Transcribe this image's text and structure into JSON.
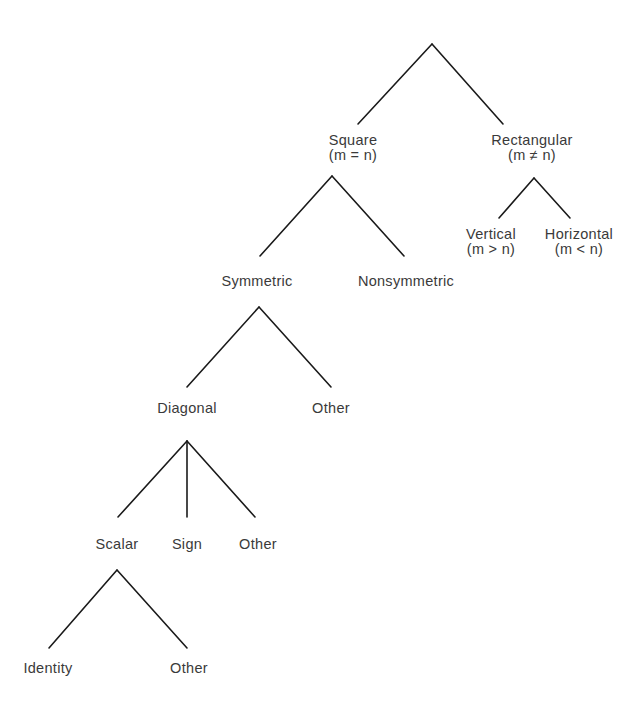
{
  "diagram": {
    "type": "tree",
    "title": "",
    "root": {
      "label": "",
      "children": [
        "square",
        "rectangular"
      ]
    },
    "nodes": {
      "square": {
        "label": "Square",
        "condition": "(m = n)",
        "x": 353,
        "y": 133
      },
      "rectangular": {
        "label": "Rectangular",
        "condition": "(m ≠ n)",
        "x": 532,
        "y": 133
      },
      "vertical": {
        "label": "Vertical",
        "condition": "(m > n)",
        "x": 491,
        "y": 227
      },
      "horizontal": {
        "label": "Horizontal",
        "condition": "(m < n)",
        "x": 579,
        "y": 227
      },
      "symmetric": {
        "label": "Symmetric",
        "x": 257,
        "y": 274
      },
      "nonsymmetric": {
        "label": "Nonsymmetric",
        "x": 406,
        "y": 274
      },
      "diagonal": {
        "label": "Diagonal",
        "x": 187,
        "y": 401
      },
      "other_symmetric": {
        "label": "Other",
        "x": 331,
        "y": 401
      },
      "scalar": {
        "label": "Scalar",
        "x": 117,
        "y": 537
      },
      "sign": {
        "label": "Sign",
        "x": 187,
        "y": 537
      },
      "other_diagonal": {
        "label": "Other",
        "x": 258,
        "y": 537
      },
      "identity": {
        "label": "Identity",
        "x": 48,
        "y": 661
      },
      "other_scalar": {
        "label": "Other",
        "x": 189,
        "y": 661
      }
    },
    "edges": [
      {
        "from": "root",
        "to": "square",
        "x1": 432,
        "y1": 44,
        "x2": 358,
        "y2": 124
      },
      {
        "from": "root",
        "to": "rectangular",
        "x1": 432,
        "y1": 44,
        "x2": 503,
        "y2": 124
      },
      {
        "from": "rectangular",
        "to": "vertical",
        "x1": 534,
        "y1": 178,
        "x2": 499,
        "y2": 218
      },
      {
        "from": "rectangular",
        "to": "horizontal",
        "x1": 534,
        "y1": 178,
        "x2": 570,
        "y2": 218
      },
      {
        "from": "square",
        "to": "symmetric",
        "x1": 332,
        "y1": 176,
        "x2": 260,
        "y2": 256
      },
      {
        "from": "square",
        "to": "nonsymmetric",
        "x1": 332,
        "y1": 176,
        "x2": 404,
        "y2": 256
      },
      {
        "from": "symmetric",
        "to": "diagonal",
        "x1": 259,
        "y1": 307,
        "x2": 187,
        "y2": 387
      },
      {
        "from": "symmetric",
        "to": "other_symmetric",
        "x1": 259,
        "y1": 307,
        "x2": 331,
        "y2": 387
      },
      {
        "from": "diagonal",
        "to": "scalar",
        "x1": 187,
        "y1": 441,
        "x2": 118,
        "y2": 517
      },
      {
        "from": "diagonal",
        "to": "sign",
        "x1": 187,
        "y1": 441,
        "x2": 187,
        "y2": 517
      },
      {
        "from": "diagonal",
        "to": "other_diagonal",
        "x1": 187,
        "y1": 441,
        "x2": 255,
        "y2": 517
      },
      {
        "from": "scalar",
        "to": "identity",
        "x1": 117,
        "y1": 570,
        "x2": 49,
        "y2": 648
      },
      {
        "from": "scalar",
        "to": "other_scalar",
        "x1": 117,
        "y1": 570,
        "x2": 187,
        "y2": 648
      }
    ],
    "colors": {
      "line": "#1a1a1a",
      "text": "#3a3a3a",
      "background": "#ffffff"
    }
  }
}
